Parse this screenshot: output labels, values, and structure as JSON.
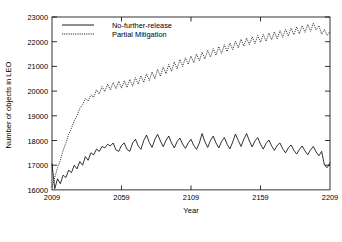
{
  "chart_data": {
    "type": "line",
    "title": "",
    "xlabel": "Year",
    "ylabel": "Number of objects in LEO",
    "xlim": [
      2009,
      2209
    ],
    "ylim": [
      16000,
      23000
    ],
    "xticks": [
      2009,
      2059,
      2109,
      2159,
      2209
    ],
    "xtick_labels": [
      "2009",
      "2059",
      "2109",
      "2159",
      "2209"
    ],
    "yticks": [
      16000,
      17000,
      18000,
      19000,
      20000,
      21000,
      22000,
      23000
    ],
    "ytick_labels": [
      "16000",
      "17000",
      "18000",
      "19000",
      "20000",
      "21000",
      "22000",
      "23000"
    ],
    "grid": false,
    "legend_position": "top-center",
    "series": [
      {
        "name": "No-further-release",
        "linestyle": "solid",
        "color": "#000000",
        "x": [
          2009,
          2011,
          2013,
          2015,
          2017,
          2019,
          2021,
          2023,
          2025,
          2027,
          2029,
          2031,
          2033,
          2035,
          2037,
          2039,
          2041,
          2043,
          2045,
          2047,
          2049,
          2051,
          2053,
          2055,
          2057,
          2059,
          2061,
          2063,
          2065,
          2067,
          2069,
          2071,
          2073,
          2075,
          2077,
          2079,
          2081,
          2083,
          2085,
          2087,
          2089,
          2091,
          2093,
          2095,
          2097,
          2099,
          2101,
          2103,
          2105,
          2107,
          2109,
          2111,
          2113,
          2115,
          2117,
          2119,
          2121,
          2123,
          2125,
          2127,
          2129,
          2131,
          2133,
          2135,
          2137,
          2139,
          2141,
          2143,
          2145,
          2147,
          2149,
          2151,
          2153,
          2155,
          2157,
          2159,
          2161,
          2163,
          2165,
          2167,
          2169,
          2171,
          2173,
          2175,
          2177,
          2179,
          2181,
          2183,
          2185,
          2187,
          2189,
          2191,
          2193,
          2195,
          2197,
          2199,
          2201,
          2203,
          2205,
          2207,
          2209
        ],
        "values": [
          17050,
          16050,
          16450,
          16250,
          16600,
          16500,
          16800,
          16700,
          17000,
          16850,
          17150,
          17000,
          17350,
          17200,
          17500,
          17420,
          17650,
          17560,
          17760,
          17700,
          17850,
          17780,
          17900,
          17620,
          17560,
          17800,
          17900,
          17640,
          17560,
          17900,
          18050,
          17780,
          17640,
          18000,
          18220,
          17920,
          17720,
          18050,
          18250,
          17980,
          17750,
          18000,
          18180,
          17900,
          17700,
          17960,
          18100,
          17850,
          17680,
          17900,
          18050,
          17800,
          17640,
          17900,
          18280,
          17950,
          17720,
          18000,
          18180,
          17900,
          17700,
          17960,
          18120,
          17850,
          17660,
          17940,
          18260,
          18000,
          17760,
          18050,
          18280,
          17980,
          17740,
          17980,
          18120,
          17850,
          17650,
          17880,
          18020,
          17780,
          17600,
          17800,
          17900,
          17660,
          17500,
          17700,
          17820,
          17600,
          17450,
          17640,
          17780,
          17580,
          17420,
          17620,
          17760,
          17540,
          17380,
          17560,
          17000,
          16900,
          17100
        ]
      },
      {
        "name": "Partial Mitigation",
        "linestyle": "dotted",
        "color": "#000000",
        "x": [
          2009,
          2011,
          2013,
          2015,
          2017,
          2019,
          2021,
          2023,
          2025,
          2027,
          2029,
          2031,
          2033,
          2035,
          2037,
          2039,
          2041,
          2043,
          2045,
          2047,
          2049,
          2051,
          2053,
          2055,
          2057,
          2059,
          2061,
          2063,
          2065,
          2067,
          2069,
          2071,
          2073,
          2075,
          2077,
          2079,
          2081,
          2083,
          2085,
          2087,
          2089,
          2091,
          2093,
          2095,
          2097,
          2099,
          2101,
          2103,
          2105,
          2107,
          2109,
          2111,
          2113,
          2115,
          2117,
          2119,
          2121,
          2123,
          2125,
          2127,
          2129,
          2131,
          2133,
          2135,
          2137,
          2139,
          2141,
          2143,
          2145,
          2147,
          2149,
          2151,
          2153,
          2155,
          2157,
          2159,
          2161,
          2163,
          2165,
          2167,
          2169,
          2171,
          2173,
          2175,
          2177,
          2179,
          2181,
          2183,
          2185,
          2187,
          2189,
          2191,
          2193,
          2195,
          2197,
          2199,
          2201,
          2203,
          2205,
          2207,
          2209
        ],
        "values": [
          16100,
          16500,
          16900,
          17200,
          17600,
          17900,
          18250,
          18500,
          18800,
          19000,
          19300,
          19450,
          19700,
          19600,
          19850,
          19750,
          20050,
          19880,
          20180,
          19980,
          20280,
          20050,
          20350,
          20100,
          20400,
          20120,
          20420,
          20150,
          20480,
          20200,
          20550,
          20280,
          20620,
          20350,
          20700,
          20420,
          20780,
          20500,
          20880,
          20600,
          20980,
          20700,
          21080,
          20800,
          21180,
          20900,
          21280,
          21000,
          21350,
          21080,
          21420,
          21150,
          21500,
          21230,
          21580,
          21300,
          21650,
          21380,
          21720,
          21450,
          21800,
          21520,
          21880,
          21600,
          21950,
          21680,
          22020,
          21750,
          22100,
          21820,
          22150,
          21880,
          22200,
          21920,
          22250,
          21980,
          22300,
          22020,
          22350,
          22080,
          22400,
          22120,
          22450,
          22180,
          22500,
          22220,
          22550,
          22280,
          22600,
          22320,
          22650,
          22380,
          22700,
          22420,
          22750,
          22480,
          22650,
          22300,
          22500,
          22250,
          22420
        ]
      }
    ]
  },
  "legend": {
    "entries": [
      {
        "label": "No-further-release"
      },
      {
        "label": "Partial Mitigation"
      }
    ]
  }
}
